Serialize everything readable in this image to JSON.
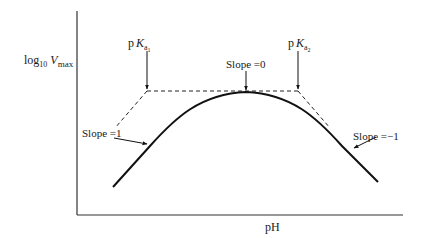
{
  "diagram": {
    "type": "pH-rate profile",
    "y_axis_label": {
      "base": "log",
      "subscript": "10",
      "variable": "V",
      "variable_subscript": "max"
    },
    "x_axis_label": "pH",
    "markers": [
      {
        "id": "pKa1",
        "prefix": "p",
        "symbol": "K",
        "subscript": "a",
        "subsubscript": "1"
      },
      {
        "id": "pKa2",
        "prefix": "p",
        "symbol": "K",
        "subscript": "a",
        "subsubscript": "2"
      }
    ],
    "annotations": {
      "slope_left": "Slope =1",
      "slope_top": "Slope =0",
      "slope_right": "Slope =−1"
    },
    "colors": {
      "ink": "#1a1a1a",
      "axis": "#333333",
      "dash": "#222222"
    }
  }
}
